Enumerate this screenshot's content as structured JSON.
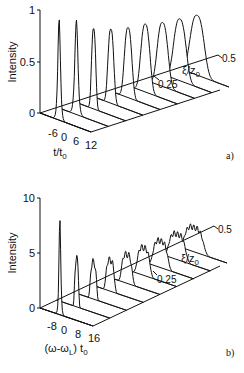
{
  "chart_data": [
    {
      "panel": "a)",
      "type": "line",
      "title": "",
      "ylabel": "Intensity",
      "xlabel": "t/t0",
      "zlabel": "ξ/z0",
      "yticks": [
        "0",
        "0.5",
        "1"
      ],
      "xticks": [
        "-6",
        "0",
        "6",
        "12"
      ],
      "zticks": [
        "0.25",
        "0.5"
      ],
      "ylim": [
        0,
        1
      ],
      "zlim": [
        0,
        0.5
      ],
      "grid": false,
      "legend": null,
      "series": [
        {
          "name": "ξ/z0=0.00",
          "peak": 0.98,
          "width": 1.0
        },
        {
          "name": "ξ/z0=0.0625",
          "peak": 0.92,
          "width": 1.2
        },
        {
          "name": "ξ/z0=0.125",
          "peak": 0.78,
          "width": 1.6
        },
        {
          "name": "ξ/z0=0.1875",
          "peak": 0.72,
          "width": 2.2
        },
        {
          "name": "ξ/z0=0.25",
          "peak": 0.68,
          "width": 2.8
        },
        {
          "name": "ξ/z0=0.3125",
          "peak": 0.66,
          "width": 3.4
        },
        {
          "name": "ξ/z0=0.375",
          "peak": 0.62,
          "width": 4.0
        },
        {
          "name": "ξ/z0=0.4375",
          "peak": 0.6,
          "width": 4.6
        },
        {
          "name": "ξ/z0=0.5",
          "peak": 0.58,
          "width": 5.2
        }
      ]
    },
    {
      "panel": "b)",
      "type": "line",
      "title": "",
      "ylabel": "Intensity",
      "xlabel": "(ω-ωL) t0",
      "zlabel": "ξ/z0",
      "yticks": [
        "0",
        "5",
        "10"
      ],
      "xticks": [
        "-8",
        "0",
        "8",
        "16"
      ],
      "zticks": [
        "0.25",
        "0.5"
      ],
      "ylim": [
        0,
        10
      ],
      "zlim": [
        0,
        0.5
      ],
      "grid": false,
      "legend": null,
      "series": [
        {
          "name": "ξ/z0=0.00",
          "peak": 8.7,
          "width": 1.0
        },
        {
          "name": "ξ/z0=0.0625",
          "peak": 4.2,
          "width": 2.0
        },
        {
          "name": "ξ/z0=0.125",
          "peak": 3.3,
          "width": 3.0
        },
        {
          "name": "ξ/z0=0.1875",
          "peak": 2.8,
          "width": 4.0
        },
        {
          "name": "ξ/z0=0.25",
          "peak": 2.6,
          "width": 5.0
        },
        {
          "name": "ξ/z0=0.3125",
          "peak": 2.5,
          "width": 6.0
        },
        {
          "name": "ξ/z0=0.375",
          "peak": 2.4,
          "width": 7.0
        },
        {
          "name": "ξ/z0=0.4375",
          "peak": 2.3,
          "width": 8.0
        },
        {
          "name": "ξ/z0=0.5",
          "peak": 2.2,
          "width": 9.0
        }
      ]
    }
  ],
  "panels": {
    "a": {
      "ylabel": "Intensity",
      "xlabel_main": "t/t",
      "xlabel_sub": "0",
      "zlabel_main": "ξ/z",
      "zlabel_sub": "0",
      "yticks": [
        "1",
        "0.5",
        "0"
      ],
      "xticks": [
        "-6",
        "0",
        "6",
        "12"
      ],
      "zticks": [
        "0.25",
        "0.5"
      ],
      "tag": "a)"
    },
    "b": {
      "ylabel": "Intensity",
      "xlabel_main": "(ω-ω",
      "xlabel_sub1": "L",
      "xlabel_mid": ") t",
      "xlabel_sub2": "0",
      "zlabel_main": "ξ/z",
      "zlabel_sub": "0",
      "yticks": [
        "10",
        "5",
        "0"
      ],
      "xticks": [
        "-8",
        "0",
        "8",
        "16"
      ],
      "zticks": [
        "0.25",
        "0.5"
      ],
      "tag": "b)"
    }
  }
}
